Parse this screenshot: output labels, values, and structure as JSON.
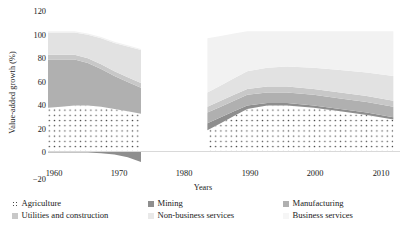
{
  "chart_data": {
    "type": "area",
    "title": "",
    "xlabel": "Years",
    "ylabel": "Value-added growth (%)",
    "stacked": true,
    "grid": false,
    "legend_position": "bottom",
    "xlim": [
      1960,
      2013
    ],
    "ylim": [
      -20,
      120
    ],
    "y_ticks": [
      "120",
      "100",
      "80",
      "60",
      "40",
      "20",
      "0",
      "−20"
    ],
    "y_tick_values": [
      120,
      100,
      80,
      60,
      40,
      20,
      0,
      -20
    ],
    "x_ticks": [
      "1960",
      "1970",
      "1980",
      "1990",
      "2000",
      "2010"
    ],
    "x_tick_values": [
      1960,
      1970,
      1980,
      1990,
      2000,
      2010
    ],
    "segments": [
      {
        "name": "panel-1",
        "x": [
          1960,
          1962,
          1964,
          1966,
          1968,
          1970,
          1972,
          1974
        ],
        "series": [
          {
            "name": "Agriculture",
            "values": [
              37,
              38,
              39,
              39,
              38,
              36,
              34,
              32
            ]
          },
          {
            "name": "Mining",
            "values": [
              -1,
              -1,
              -1,
              -1,
              -1.5,
              -2.5,
              -5,
              -9
            ]
          },
          {
            "name": "Manufacturing",
            "values": [
              41,
              40,
              39,
              36,
              32,
              28,
              25,
              22
            ]
          },
          {
            "name": "Utilities and construction",
            "values": [
              4,
              4,
              4,
              4,
              4,
              4,
              4,
              4
            ]
          },
          {
            "name": "Non-business services",
            "values": [
              19,
              19,
              19,
              20,
              22,
              24,
              26,
              28
            ]
          },
          {
            "name": "Business services",
            "values": [
              1,
              1,
              1,
              1,
              1,
              1,
              1,
              1
            ]
          }
        ]
      },
      {
        "name": "panel-2",
        "x": [
          1984,
          1986,
          1988,
          1990,
          1993,
          1996,
          2000,
          2004,
          2008,
          2012
        ],
        "series": [
          {
            "name": "Agriculture",
            "values": [
              18,
              24,
              30,
              36,
              39,
              39,
              37,
              34,
              31,
              27
            ]
          },
          {
            "name": "Mining",
            "values": [
              6,
              5,
              4,
              3,
              2,
              2,
              2,
              2,
              2,
              2
            ]
          },
          {
            "name": "Manufacturing",
            "values": [
              9,
              9,
              9,
              9,
              9,
              9,
              9,
              9,
              9,
              9
            ]
          },
          {
            "name": "Utilities and construction",
            "values": [
              5,
              5,
              5,
              5,
              5,
              5,
              5,
              5,
              5,
              5
            ]
          },
          {
            "name": "Non-business services",
            "values": [
              12,
              13,
              14,
              15,
              16,
              17,
              18,
              19,
              20,
              21
            ]
          },
          {
            "name": "Business services",
            "values": [
              46,
              42,
              38,
              34,
              31,
              30,
              31,
              33,
              35,
              38
            ]
          }
        ]
      }
    ],
    "legend": [
      {
        "label": "Agriculture",
        "swatch": "dotted",
        "color": "#ffffff"
      },
      {
        "label": "Mining",
        "swatch": "solid",
        "color": "#8e8e8e"
      },
      {
        "label": "Manufacturing",
        "swatch": "solid",
        "color": "#b0b0b0"
      },
      {
        "label": "Utilities and construction",
        "swatch": "solid",
        "color": "#c8c8c8"
      },
      {
        "label": "Non-business services",
        "swatch": "solid",
        "color": "#e2e2e2"
      },
      {
        "label": "Business services",
        "swatch": "solid",
        "color": "#f2f2f2"
      }
    ]
  },
  "colors": {
    "agriculture": "#ffffff",
    "mining": "#8e8e8e",
    "manufacturing": "#b0b0b0",
    "utilities": "#c8c8c8",
    "non_business": "#e2e2e2",
    "business": "#f2f2f2",
    "dot": "#4a4a4a",
    "axis": "#d9d9d9",
    "text": "#1a1a1a"
  }
}
